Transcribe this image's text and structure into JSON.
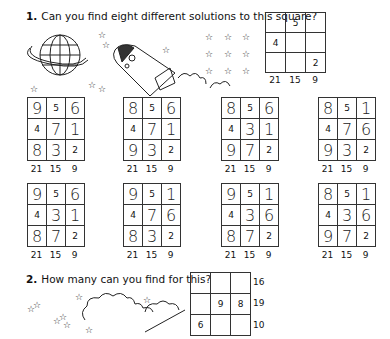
{
  "question1": {
    "number": "1.",
    "text": "Can you find eight different solutions to this square?",
    "template_grid": {
      "cells": [
        [
          "",
          "5",
          ""
        ],
        [
          "4",
          "",
          ""
        ],
        [
          "",
          "",
          "2"
        ]
      ],
      "column_sums": [
        "21",
        "15",
        "9"
      ]
    },
    "solutions": [
      {
        "cells": [
          [
            "9",
            "5",
            "6"
          ],
          [
            "4",
            "7",
            "1"
          ],
          [
            "8",
            "3",
            "2"
          ]
        ],
        "column_sums": [
          "21",
          "15",
          "9"
        ]
      },
      {
        "cells": [
          [
            "8",
            "5",
            "6"
          ],
          [
            "4",
            "7",
            "1"
          ],
          [
            "9",
            "3",
            "2"
          ]
        ],
        "column_sums": [
          "21",
          "15",
          "9"
        ]
      },
      {
        "cells": [
          [
            "8",
            "5",
            "6"
          ],
          [
            "4",
            "3",
            "1"
          ],
          [
            "9",
            "7",
            "2"
          ]
        ],
        "column_sums": [
          "21",
          "15",
          "9"
        ]
      },
      {
        "cells": [
          [
            "8",
            "5",
            "1"
          ],
          [
            "4",
            "7",
            "6"
          ],
          [
            "9",
            "3",
            "2"
          ]
        ],
        "column_sums": [
          "21",
          "15",
          "9"
        ]
      },
      {
        "cells": [
          [
            "9",
            "5",
            "6"
          ],
          [
            "4",
            "3",
            "1"
          ],
          [
            "8",
            "7",
            "2"
          ]
        ],
        "column_sums": [
          "21",
          "15",
          "9"
        ]
      },
      {
        "cells": [
          [
            "9",
            "5",
            "1"
          ],
          [
            "4",
            "7",
            "6"
          ],
          [
            "8",
            "3",
            "2"
          ]
        ],
        "column_sums": [
          "21",
          "15",
          "9"
        ]
      },
      {
        "cells": [
          [
            "9",
            "5",
            "1"
          ],
          [
            "4",
            "3",
            "6"
          ],
          [
            "8",
            "7",
            "2"
          ]
        ],
        "column_sums": [
          "21",
          "15",
          "9"
        ]
      },
      {
        "cells": [
          [
            "8",
            "5",
            "1"
          ],
          [
            "4",
            "3",
            "6"
          ],
          [
            "9",
            "7",
            "2"
          ]
        ],
        "column_sums": [
          "21",
          "15",
          "9"
        ]
      }
    ]
  },
  "question2": {
    "number": "2.",
    "text": "How many can you find for this?",
    "grid": {
      "cells": [
        [
          "",
          "",
          ""
        ],
        [
          "",
          "9",
          "8"
        ],
        [
          "6",
          "",
          ""
        ]
      ],
      "row_sums": [
        "16",
        "19",
        "10"
      ]
    }
  },
  "illustrations": [
    "planet-with-ring",
    "rocket",
    "stars",
    "clouds"
  ]
}
